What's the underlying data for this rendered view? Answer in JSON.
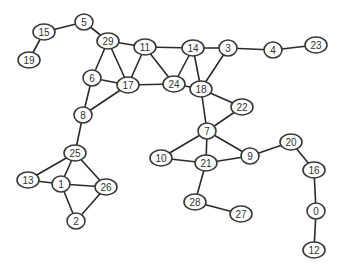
{
  "diagram": {
    "type": "undirected-graph",
    "colors": {
      "edge": "#2a2a2a",
      "node_stroke": "#3a3a3a",
      "node_fill": "#ffffff",
      "label": "#333333"
    },
    "nodes": [
      {
        "id": "5",
        "x": 84,
        "y": 22
      },
      {
        "id": "15",
        "x": 44,
        "y": 32
      },
      {
        "id": "19",
        "x": 29,
        "y": 60
      },
      {
        "id": "29",
        "x": 108,
        "y": 41
      },
      {
        "id": "11",
        "x": 145,
        "y": 47
      },
      {
        "id": "14",
        "x": 193,
        "y": 48
      },
      {
        "id": "3",
        "x": 228,
        "y": 48
      },
      {
        "id": "4",
        "x": 273,
        "y": 50
      },
      {
        "id": "23",
        "x": 316,
        "y": 45
      },
      {
        "id": "6",
        "x": 92,
        "y": 78
      },
      {
        "id": "17",
        "x": 128,
        "y": 85
      },
      {
        "id": "24",
        "x": 174,
        "y": 84
      },
      {
        "id": "18",
        "x": 201,
        "y": 89
      },
      {
        "id": "22",
        "x": 242,
        "y": 107
      },
      {
        "id": "8",
        "x": 83,
        "y": 115
      },
      {
        "id": "7",
        "x": 207,
        "y": 131
      },
      {
        "id": "25",
        "x": 75,
        "y": 153
      },
      {
        "id": "13",
        "x": 28,
        "y": 180
      },
      {
        "id": "1",
        "x": 61,
        "y": 184
      },
      {
        "id": "26",
        "x": 106,
        "y": 187
      },
      {
        "id": "2",
        "x": 76,
        "y": 221
      },
      {
        "id": "10",
        "x": 161,
        "y": 158
      },
      {
        "id": "21",
        "x": 206,
        "y": 163
      },
      {
        "id": "9",
        "x": 250,
        "y": 156
      },
      {
        "id": "20",
        "x": 291,
        "y": 142
      },
      {
        "id": "16",
        "x": 314,
        "y": 170
      },
      {
        "id": "0",
        "x": 316,
        "y": 211
      },
      {
        "id": "12",
        "x": 314,
        "y": 250
      },
      {
        "id": "28",
        "x": 195,
        "y": 202
      },
      {
        "id": "27",
        "x": 241,
        "y": 214
      }
    ],
    "edges": [
      [
        "15",
        "5"
      ],
      [
        "15",
        "19"
      ],
      [
        "5",
        "29"
      ],
      [
        "29",
        "11"
      ],
      [
        "29",
        "17"
      ],
      [
        "29",
        "6"
      ],
      [
        "11",
        "17"
      ],
      [
        "11",
        "24"
      ],
      [
        "11",
        "14"
      ],
      [
        "14",
        "24"
      ],
      [
        "14",
        "18"
      ],
      [
        "14",
        "3"
      ],
      [
        "17",
        "24"
      ],
      [
        "24",
        "18"
      ],
      [
        "6",
        "17"
      ],
      [
        "17",
        "8"
      ],
      [
        "6",
        "8"
      ],
      [
        "18",
        "3"
      ],
      [
        "3",
        "4"
      ],
      [
        "4",
        "23"
      ],
      [
        "18",
        "22"
      ],
      [
        "18",
        "7"
      ],
      [
        "7",
        "22"
      ],
      [
        "7",
        "10"
      ],
      [
        "7",
        "21"
      ],
      [
        "7",
        "9"
      ],
      [
        "10",
        "21"
      ],
      [
        "21",
        "9"
      ],
      [
        "21",
        "28"
      ],
      [
        "28",
        "27"
      ],
      [
        "9",
        "20"
      ],
      [
        "20",
        "16"
      ],
      [
        "16",
        "0"
      ],
      [
        "0",
        "12"
      ],
      [
        "8",
        "25"
      ],
      [
        "25",
        "13"
      ],
      [
        "25",
        "1"
      ],
      [
        "25",
        "26"
      ],
      [
        "13",
        "1"
      ],
      [
        "1",
        "26"
      ],
      [
        "1",
        "2"
      ],
      [
        "2",
        "26"
      ]
    ]
  }
}
